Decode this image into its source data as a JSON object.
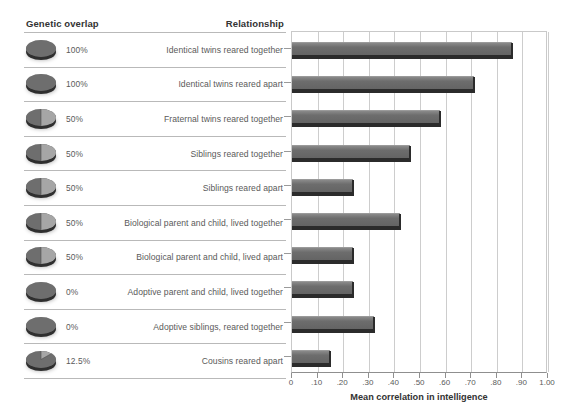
{
  "table": {
    "headers": {
      "genetic_overlap": "Genetic overlap",
      "relationship": "Relationship"
    },
    "rows": [
      {
        "percent": "100%",
        "pie_fraction": 1.0,
        "relationship": "Identical twins reared together"
      },
      {
        "percent": "100%",
        "pie_fraction": 1.0,
        "relationship": "Identical twins reared apart"
      },
      {
        "percent": "50%",
        "pie_fraction": 0.5,
        "relationship": "Fraternal twins reared together"
      },
      {
        "percent": "50%",
        "pie_fraction": 0.5,
        "relationship": "Siblings reared together"
      },
      {
        "percent": "50%",
        "pie_fraction": 0.5,
        "relationship": "Siblings reared apart"
      },
      {
        "percent": "50%",
        "pie_fraction": 0.5,
        "relationship": "Biological parent and child, lived together"
      },
      {
        "percent": "50%",
        "pie_fraction": 0.5,
        "relationship": "Biological parent and child, lived apart"
      },
      {
        "percent": "0%",
        "pie_fraction": 0.0,
        "relationship": "Adoptive parent and child, lived together"
      },
      {
        "percent": "0%",
        "pie_fraction": 0.0,
        "relationship": "Adoptive siblings, reared together"
      },
      {
        "percent": "12.5%",
        "pie_fraction": 0.125,
        "relationship": "Cousins reared apart"
      }
    ]
  },
  "chart_data": {
    "type": "bar",
    "orientation": "horizontal",
    "title": "",
    "xlabel": "Mean correlation in intelligence",
    "ylabel": "",
    "xlim": [
      0,
      1.0
    ],
    "xticks": [
      0,
      0.1,
      0.2,
      0.3,
      0.4,
      0.5,
      0.6,
      0.7,
      0.8,
      0.9,
      1.0
    ],
    "xticklabels": [
      "0",
      ".10",
      ".20",
      ".30",
      ".40",
      ".50",
      ".60",
      ".70",
      ".80",
      ".90",
      "1.00"
    ],
    "grid": "vertical",
    "legend": "none",
    "categories": [
      "Identical twins reared together",
      "Identical twins reared apart",
      "Fraternal twins reared together",
      "Siblings reared together",
      "Siblings reared apart",
      "Biological parent and child, lived together",
      "Biological parent and child, lived apart",
      "Adoptive parent and child, lived together",
      "Adoptive siblings, reared together",
      "Cousins reared apart"
    ],
    "values": [
      0.86,
      0.71,
      0.58,
      0.46,
      0.24,
      0.42,
      0.24,
      0.24,
      0.32,
      0.15
    ],
    "bar_color": "#6d6d6d"
  },
  "colors": {
    "bar": "#6d6d6d",
    "bar_base": "#2b2b2b",
    "grid": "#cdcdcd",
    "rule": "#b9b9b9",
    "header_text": "#333333",
    "body_text": "#5a5a5a",
    "pie_light": "#a6a6a6",
    "pie_dark": "#6e6e6e"
  }
}
